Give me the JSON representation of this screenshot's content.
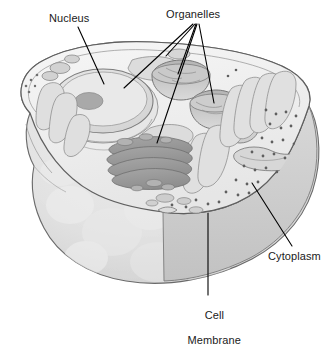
{
  "diagram": {
    "background_color": "#ffffff",
    "line_color": "#000000",
    "labels": {
      "nucleus": "Nucleus",
      "organelles": "Organelles",
      "cytoplasm": "Cytoplasm",
      "cell_membrane_line1": "Cell",
      "cell_membrane_line2": "Membrane"
    },
    "palette": {
      "outline": "#5a5a5a",
      "membrane_top": "#f2f2f2",
      "cytoplasm_body": "#e4e4e4",
      "cytoplasm_shadow": "#d2d2d2",
      "cut_face": "#cfcfcf",
      "nucleus_fill": "#e0e0e0",
      "nucleolus": "#a8a8a8",
      "golgi": "#9a9a9a",
      "er_tubule": "#dcdcdc",
      "vesicle": "#c4c4c4",
      "ribosome_dot": "#6f6f6f"
    }
  }
}
